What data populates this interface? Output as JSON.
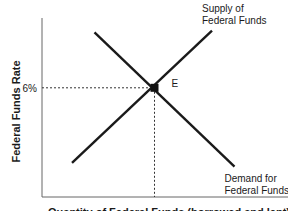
{
  "chart_data": {
    "type": "line",
    "title": "",
    "xlabel": "Quantity of Federal Funds (borrowed and lent)",
    "ylabel": "Federal Funds Rate",
    "axis_units": "relative (0-100 in each direction)",
    "xlim": [
      0,
      100
    ],
    "ylim": [
      0,
      100
    ],
    "grid": false,
    "series": [
      {
        "name": "Demand",
        "label_lines": [
          "Demand for",
          "Federal Funds"
        ],
        "points": [
          [
            21,
            92
          ],
          [
            77,
            17
          ]
        ]
      },
      {
        "name": "Supply",
        "label_lines": [
          "Supply of",
          "Federal Funds"
        ],
        "points": [
          [
            12,
            19
          ],
          [
            68,
            93
          ]
        ]
      }
    ],
    "equilibrium": {
      "label": "E",
      "x": 45,
      "y": 61,
      "rate_label": "6%"
    },
    "colors": {
      "line": "#1a1a1a",
      "axis": "#555555",
      "text": "#1a1a1a"
    }
  }
}
